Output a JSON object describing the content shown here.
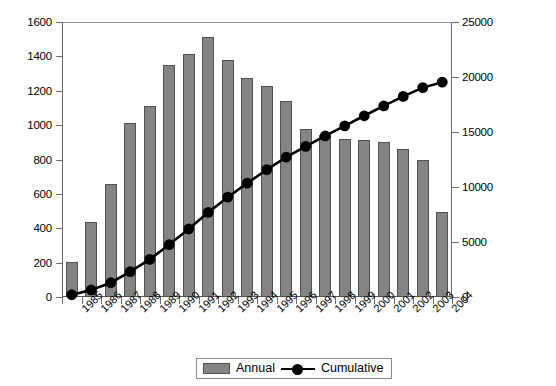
{
  "chart_data": {
    "type": "bar",
    "title": "",
    "subtitle": "",
    "xlabel": "",
    "ylabel": "",
    "y2label": "",
    "grid": false,
    "legend_position": "bottom-center",
    "categories": [
      "1985",
      "1986",
      "1987",
      "1988",
      "1989",
      "1990",
      "1991",
      "1992",
      "1993",
      "1994",
      "1995",
      "1996",
      "1997",
      "1998",
      "1999",
      "2000",
      "2001",
      "2002",
      "2003",
      "2004"
    ],
    "series": [
      {
        "name": "Annual",
        "type": "bar",
        "axis": "left",
        "color": "#848484",
        "border_color": "#4f4f4f",
        "values": [
          205,
          435,
          655,
          1010,
          1110,
          1350,
          1415,
          1515,
          1380,
          1275,
          1230,
          1140,
          975,
          945,
          920,
          915,
          900,
          860,
          800,
          495
        ]
      },
      {
        "name": "Cumulative",
        "type": "line",
        "axis": "right",
        "color": "#000000",
        "marker": "circle",
        "values": [
          205,
          640,
          1295,
          2305,
          3415,
          4765,
          6180,
          7695,
          9075,
          10350,
          11580,
          12720,
          13695,
          14640,
          15560,
          16475,
          17375,
          18235,
          19035,
          19530
        ]
      }
    ],
    "yaxis_left": {
      "min": 0,
      "max": 1600,
      "step": 200,
      "ticks": [
        "0",
        "200",
        "400",
        "600",
        "800",
        "1000",
        "1200",
        "1400",
        "1600"
      ]
    },
    "yaxis_right": {
      "min": 0,
      "max": 25000,
      "step": 5000,
      "ticks": [
        "0",
        "5000",
        "10000",
        "15000",
        "20000",
        "25000"
      ]
    }
  },
  "legend": {
    "annual_label": "Annual",
    "cumulative_label": "Cumulative"
  }
}
